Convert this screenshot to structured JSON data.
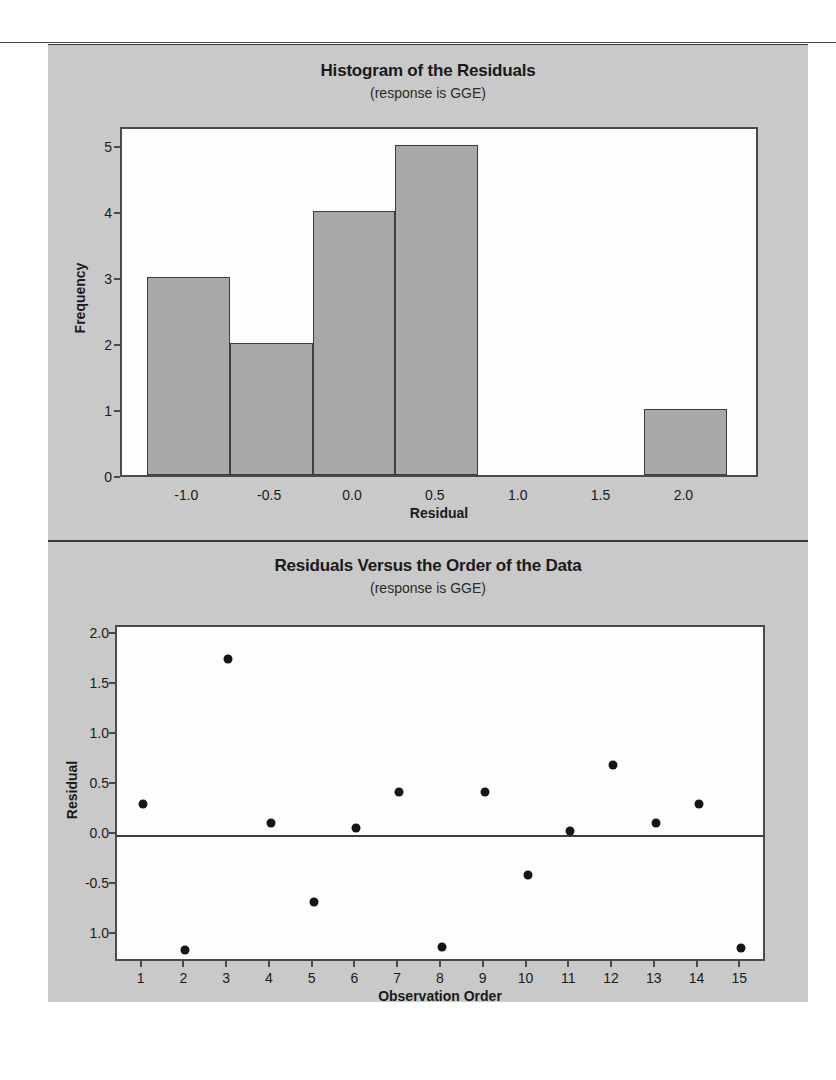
{
  "page": {
    "background": "#ffffff",
    "panel_background": "#c9c9c9",
    "plot_background": "#fdfdfd",
    "bar_fill": "#a8a8a8",
    "line_color": "#3d3d3d",
    "marker_color": "#151515"
  },
  "charts": [
    {
      "id": "histogram",
      "title": "Histogram of the Residuals",
      "subtitle": "(response is GGE)",
      "xlabel": "Residual",
      "ylabel": "Frequency"
    },
    {
      "id": "scatter",
      "title": "Residuals Versus the Order of the Data",
      "subtitle": "(response is GGE)",
      "xlabel": "Observation Order",
      "ylabel": "Residual"
    }
  ],
  "chart_data": [
    {
      "type": "bar",
      "title": "Histogram of the Residuals",
      "subtitle": "(response is GGE)",
      "xlabel": "Residual",
      "ylabel": "Frequency",
      "xlim": [
        -1.4,
        2.45
      ],
      "ylim": [
        0,
        5.3
      ],
      "grid": false,
      "legend": null,
      "xticks": [
        "-1.0",
        "-0.5",
        "0.0",
        "0.5",
        "1.0",
        "1.5",
        "2.0"
      ],
      "xtick_values": [
        -1.0,
        -0.5,
        0.0,
        0.5,
        1.0,
        1.5,
        2.0
      ],
      "yticks": [
        "0",
        "1",
        "2",
        "3",
        "4",
        "5"
      ],
      "ytick_values": [
        0,
        1,
        2,
        3,
        4,
        5
      ],
      "bins": [
        {
          "left": -1.25,
          "right": -0.75,
          "center": -1.0,
          "frequency": 3
        },
        {
          "left": -0.75,
          "right": -0.25,
          "center": -0.5,
          "frequency": 2
        },
        {
          "left": -0.25,
          "right": 0.25,
          "center": 0.0,
          "frequency": 4
        },
        {
          "left": 0.25,
          "right": 0.75,
          "center": 0.5,
          "frequency": 5
        },
        {
          "left": 1.75,
          "right": 2.25,
          "center": 2.0,
          "frequency": 1
        }
      ],
      "categories": [
        "-1.0",
        "-0.5",
        "0.0",
        "0.5",
        "2.0"
      ],
      "values": [
        3,
        2,
        4,
        5,
        1
      ]
    },
    {
      "type": "scatter",
      "title": "Residuals Versus the Order of the Data",
      "subtitle": "(response is GGE)",
      "xlabel": "Observation Order",
      "ylabel": "Residual",
      "xlim": [
        0.4,
        15.6
      ],
      "ylim": [
        -1.28,
        2.08
      ],
      "grid": false,
      "legend": null,
      "reference_line": 0.0,
      "xticks": [
        "1",
        "2",
        "3",
        "4",
        "5",
        "6",
        "7",
        "8",
        "9",
        "10",
        "11",
        "12",
        "13",
        "14",
        "15"
      ],
      "xtick_values": [
        1,
        2,
        3,
        4,
        5,
        6,
        7,
        8,
        9,
        10,
        11,
        12,
        13,
        14,
        15
      ],
      "yticks": [
        "2.0",
        "1.5",
        "1.0",
        "0.5",
        "0.0",
        "-0.5",
        "1.0"
      ],
      "ytick_values": [
        2.0,
        1.5,
        1.0,
        0.5,
        0.0,
        -0.5,
        -1.0
      ],
      "x": [
        1,
        2,
        3,
        4,
        5,
        6,
        7,
        8,
        9,
        10,
        11,
        12,
        13,
        14,
        15
      ],
      "values": [
        0.31,
        -1.15,
        1.76,
        0.12,
        -0.67,
        0.07,
        0.43,
        -1.12,
        0.43,
        -0.4,
        0.04,
        0.7,
        0.12,
        0.31,
        -1.13
      ]
    }
  ]
}
